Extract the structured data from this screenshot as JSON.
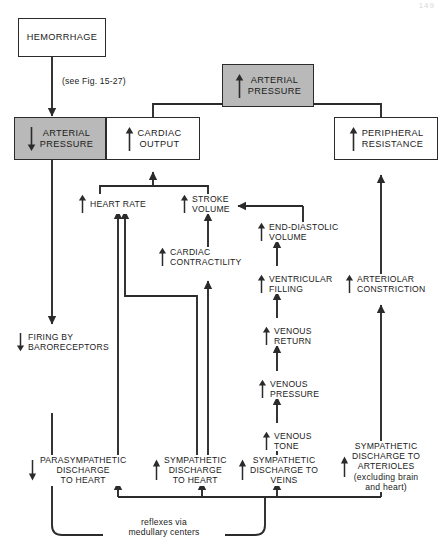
{
  "figure": {
    "folio": "149",
    "note_label": "(see Fig. 15-27)",
    "reflex_label": "reflexes via\nmedullary centers"
  },
  "nodes": {
    "hemorrhage": {
      "label": "HEMORRHAGE",
      "arrow": "none",
      "boxed": true,
      "shaded": false
    },
    "arterial_pressure_down": {
      "label": "ARTERIAL\nPRESSURE",
      "arrow": "down",
      "boxed": true,
      "shaded": true
    },
    "arterial_pressure_up": {
      "label": "ARTERIAL\nPRESSURE",
      "arrow": "up",
      "boxed": true,
      "shaded": true
    },
    "cardiac_output": {
      "label": "CARDIAC\nOUTPUT",
      "arrow": "up",
      "boxed": true,
      "shaded": false
    },
    "peripheral_resistance": {
      "label": "PERIPHERAL\nRESISTANCE",
      "arrow": "up",
      "boxed": true,
      "shaded": false
    },
    "heart_rate": {
      "label": "HEART RATE",
      "arrow": "up",
      "boxed": false,
      "shaded": false
    },
    "stroke_volume": {
      "label": "STROKE\nVOLUME",
      "arrow": "up",
      "boxed": false,
      "shaded": false
    },
    "cardiac_contractility": {
      "label": "CARDIAC\nCONTRACTILITY",
      "arrow": "up",
      "boxed": false,
      "shaded": false
    },
    "end_diastolic_volume": {
      "label": "END-DIASTOLIC\nVOLUME",
      "arrow": "up",
      "boxed": false,
      "shaded": false
    },
    "ventricular_filling": {
      "label": "VENTRICULAR\nFILLING",
      "arrow": "up",
      "boxed": false,
      "shaded": false
    },
    "venous_return": {
      "label": "VENOUS\nRETURN",
      "arrow": "up",
      "boxed": false,
      "shaded": false
    },
    "venous_pressure": {
      "label": "VENOUS\nPRESSURE",
      "arrow": "up",
      "boxed": false,
      "shaded": false
    },
    "venous_tone": {
      "label": "VENOUS\nTONE",
      "arrow": "up",
      "boxed": false,
      "shaded": false
    },
    "arteriolar_constriction": {
      "label": "ARTERIOLAR\nCONSTRICTION",
      "arrow": "up",
      "boxed": false,
      "shaded": false
    },
    "firing_baroreceptors": {
      "label": "FIRING BY\nBARORECEPTORS",
      "arrow": "down",
      "boxed": false,
      "shaded": false
    },
    "parasympathetic_heart": {
      "label": "PARASYMPATHETIC\nDISCHARGE\nTO HEART",
      "arrow": "down",
      "boxed": false,
      "shaded": false
    },
    "sympathetic_heart": {
      "label": "SYMPATHETIC\nDISCHARGE\nTO HEART",
      "arrow": "up",
      "boxed": false,
      "shaded": false
    },
    "sympathetic_veins": {
      "label": "SYMPATHETIC\nDISCHARGE TO\nVEINS",
      "arrow": "up",
      "boxed": false,
      "shaded": false
    },
    "sympathetic_arterioles": {
      "label": "SYMPATHETIC\nDISCHARGE TO\nARTERIOLES\n(excluding brain\nand heart)",
      "arrow": "up",
      "boxed": false,
      "shaded": false
    }
  },
  "colors": {
    "line": "#2b2b2b",
    "shaded_fill": "#b9b9b9",
    "background": "#ffffff"
  }
}
